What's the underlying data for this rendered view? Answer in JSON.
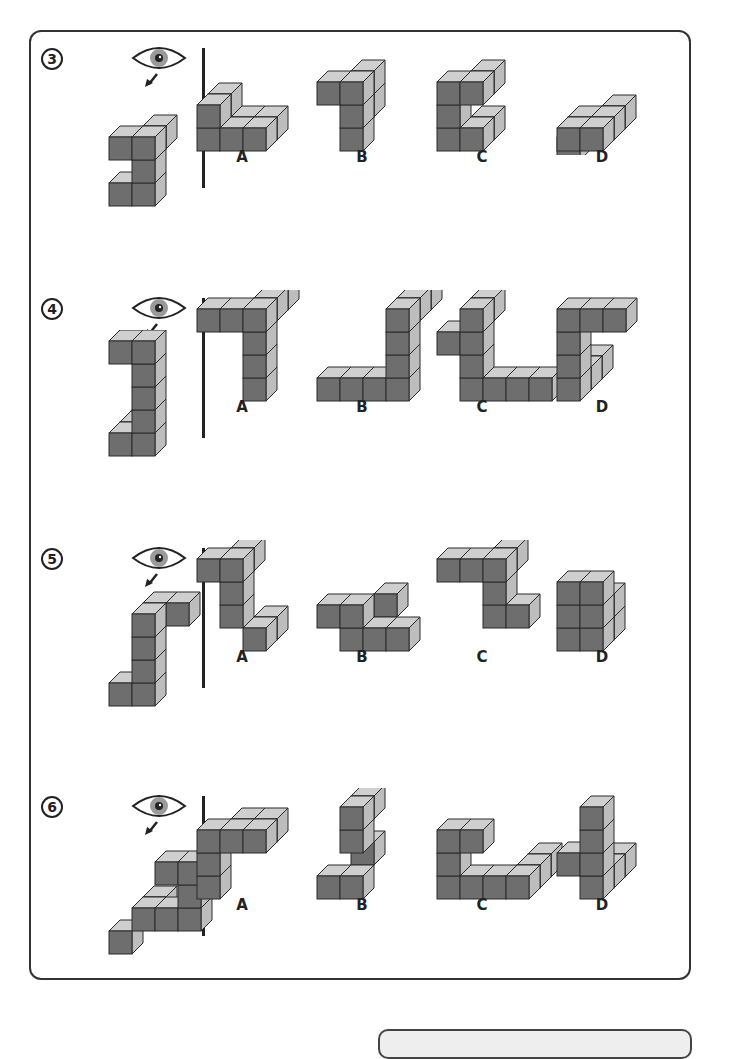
{
  "worksheet": {
    "instruction_icon": "eye-icon",
    "questions": [
      {
        "number": "3",
        "options": [
          {
            "label": "A"
          },
          {
            "label": "B"
          },
          {
            "label": "C"
          },
          {
            "label": "D"
          }
        ]
      },
      {
        "number": "4",
        "options": [
          {
            "label": "A"
          },
          {
            "label": "B"
          },
          {
            "label": "C"
          },
          {
            "label": "D"
          }
        ]
      },
      {
        "number": "5",
        "options": [
          {
            "label": "A"
          },
          {
            "label": "B"
          },
          {
            "label": "C"
          },
          {
            "label": "D"
          }
        ]
      },
      {
        "number": "6",
        "options": [
          {
            "label": "A"
          },
          {
            "label": "B"
          },
          {
            "label": "C"
          },
          {
            "label": "D"
          }
        ]
      }
    ],
    "colors": {
      "front": "#6e6e6e",
      "top": "#cfcfcf",
      "side": "#bdbdbd",
      "outline": "#2a2a2a"
    }
  }
}
